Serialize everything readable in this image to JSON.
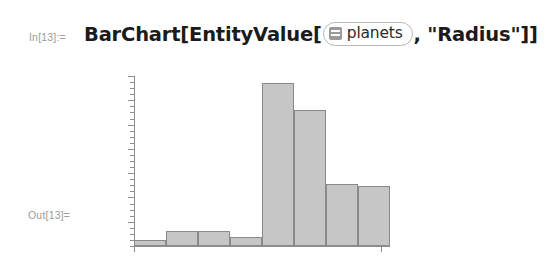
{
  "cell": {
    "in_label": "In[13]:=",
    "out_label": "Out[13]=",
    "input_expression_prefix": "BarChart[EntityValue[",
    "input_expression_suffix": ", \"Radius\"]]",
    "entity": {
      "icon": "entity-class-icon",
      "label": "planets"
    }
  },
  "colors": {
    "bar_fill": "#c6c6c6",
    "bar_stroke": "#8a8a8a",
    "axis": "#8e8e8e",
    "label_text": "#9b9b9b",
    "expression_text": "#1b1b1b",
    "chip_border": "#b9b9b9",
    "background": "#ffffff"
  },
  "chart_data": {
    "type": "bar",
    "title": "",
    "xlabel": "",
    "ylabel": "",
    "grid": false,
    "legend": false,
    "categories": [
      "Mercury",
      "Venus",
      "Earth",
      "Mars",
      "Jupiter",
      "Saturn",
      "Uranus",
      "Neptune"
    ],
    "values": [
      2440,
      6052,
      6371,
      3390,
      69911,
      58232,
      25362,
      24622
    ],
    "unit": "km",
    "ylim": [
      0,
      75000
    ],
    "axis_ticks": {
      "y_major_count": 7,
      "y_minor_per_major": 4,
      "labels_shown": false
    },
    "bars": [
      {
        "category": "Mercury",
        "value": 2440,
        "pixel_height": 6,
        "pixel_left": 0,
        "pixel_width": 32
      },
      {
        "category": "Venus",
        "value": 6052,
        "pixel_height": 15,
        "pixel_left": 32,
        "pixel_width": 32
      },
      {
        "category": "Earth",
        "value": 6371,
        "pixel_height": 15,
        "pixel_left": 64,
        "pixel_width": 32
      },
      {
        "category": "Mars",
        "value": 3390,
        "pixel_height": 9,
        "pixel_left": 96,
        "pixel_width": 32
      },
      {
        "category": "Jupiter",
        "value": 69911,
        "pixel_height": 163,
        "pixel_left": 128,
        "pixel_width": 32
      },
      {
        "category": "Saturn",
        "value": 58232,
        "pixel_height": 136,
        "pixel_left": 160,
        "pixel_width": 32
      },
      {
        "category": "Uranus",
        "value": 25362,
        "pixel_height": 62,
        "pixel_left": 192,
        "pixel_width": 32
      },
      {
        "category": "Neptune",
        "value": 24622,
        "pixel_height": 60,
        "pixel_left": 224,
        "pixel_width": 32
      }
    ]
  }
}
